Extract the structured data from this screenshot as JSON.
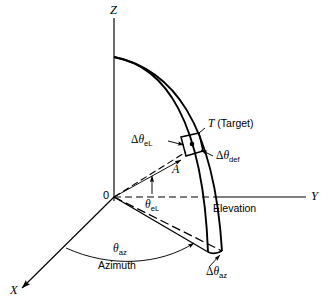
{
  "figure": {
    "kind": "radar-spherical-coordinate-diagram",
    "axes": {
      "z_label": "Z",
      "y_label": "Y",
      "x_label": "X",
      "origin_label": "0"
    },
    "labels": {
      "target": "T (Target)",
      "target_symbol": "T",
      "target_word": "(Target)",
      "point_a": "A",
      "elevation_word": "Elevation",
      "azimuth_word": "Azimuth",
      "theta_el_symbol": "θ",
      "theta_el_sub": "eL",
      "theta_az_symbol": "θ",
      "theta_az_sub": "az",
      "delta_symbol": "Δ",
      "delta_theta_el_sub": "eL",
      "delta_theta_def_sub": "def",
      "delta_theta_az_sub": "az"
    },
    "colors": {
      "ink": "#000000",
      "background": "#ffffff"
    }
  }
}
